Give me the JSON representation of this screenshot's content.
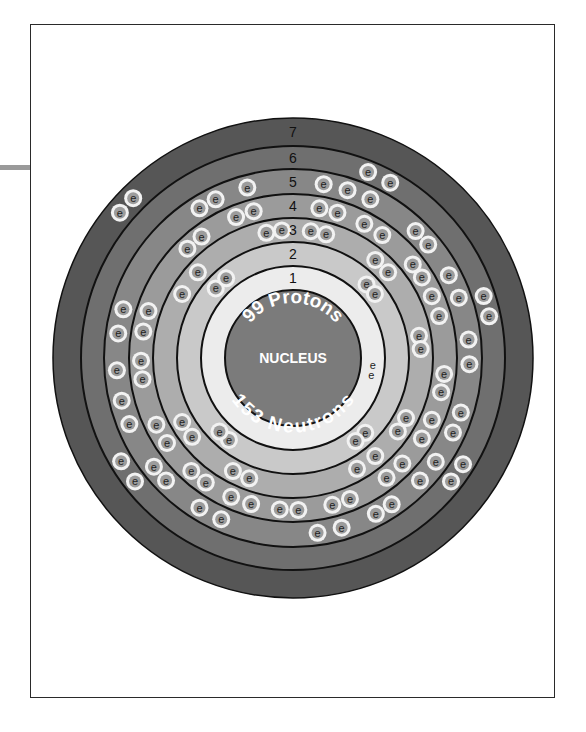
{
  "element": {
    "protons_label": "99 Protons",
    "neutrons_label": "153 Neutrons",
    "nucleus_label": "NUCLEUS",
    "electron_symbol": "e"
  },
  "shells": [
    {
      "number": "1",
      "electrons": 2,
      "color": "#ececec"
    },
    {
      "number": "2",
      "electrons": 8,
      "color": "#c9c9c9"
    },
    {
      "number": "3",
      "electrons": 18,
      "color": "#adadad"
    },
    {
      "number": "4",
      "electrons": 32,
      "color": "#9b9b9b"
    },
    {
      "number": "5",
      "electrons": 29,
      "color": "#878787"
    },
    {
      "number": "6",
      "electrons": 8,
      "color": "#6f6f6f"
    },
    {
      "number": "7",
      "electrons": 2,
      "color": "#565656"
    }
  ],
  "colors": {
    "nucleus": "#7b7b7b",
    "electron_fill": "#9c9c9c",
    "electron_halo": "#f2f2f2",
    "ring_line": "#111111"
  }
}
